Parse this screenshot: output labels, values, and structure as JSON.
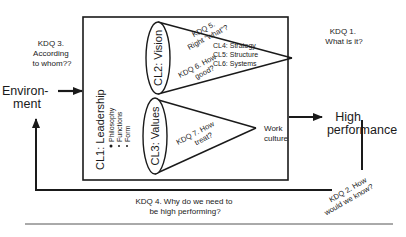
{
  "diagram": {
    "environment": {
      "line1": "Environ-",
      "line2": "ment"
    },
    "high_performance": {
      "line1": "High",
      "line2": "performance"
    },
    "kdq1": {
      "line1": "KDQ 1.",
      "line2": "What is it?"
    },
    "kdq2": {
      "line1": "KDQ 2. How",
      "line2": "would we know?"
    },
    "kdq3": {
      "line1": "KDQ 3.",
      "line2": "According",
      "line3": "to whom??"
    },
    "kdq4": {
      "line1": "KDQ 4. Why do we need to",
      "line2": "be high performing?"
    },
    "kdq5": {
      "line1": "KDQ 5.",
      "line2": "Right “what”?"
    },
    "kdq6": {
      "line1": "KDQ 6. How",
      "line2": "good?"
    },
    "kdq7": {
      "line1": "KDQ 7. How",
      "line2": "treat?"
    },
    "cl1": {
      "title": "CL1: Leadership",
      "bullets": [
        "Philosophy",
        "Functions",
        "Form"
      ]
    },
    "cl2": {
      "title": "CL2: Vision"
    },
    "cl3": {
      "title": "CL3: Values"
    },
    "cl_list": [
      "CL4: Strategy",
      "CL5: Structure",
      "CL6: Systems"
    ],
    "work_culture": {
      "line1": "Work",
      "line2": "culture"
    },
    "colors": {
      "stroke": "#1a1a1a",
      "rule": "#555555",
      "background": "#ffffff"
    }
  }
}
